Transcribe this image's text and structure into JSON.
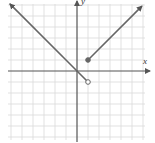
{
  "chart_data": {
    "type": "line",
    "title": "",
    "xlabel": "x",
    "ylabel": "y",
    "grid": true,
    "xlim": [
      -6,
      6
    ],
    "ylim": [
      -6,
      6
    ],
    "grid_spacing": 1,
    "tick_labels": false,
    "series": [
      {
        "name": "left-piece",
        "equation": "y = -x",
        "domain": "x < 1",
        "points": [
          [
            -6.1,
            6.1
          ],
          [
            0,
            0
          ],
          [
            1,
            -1
          ]
        ],
        "start_arrow": true,
        "end_marker": "open-circle"
      },
      {
        "name": "right-piece",
        "equation": "y = x",
        "domain": "x >= 1",
        "points": [
          [
            1,
            1
          ],
          [
            5.9,
            5.9
          ]
        ],
        "start_marker": "filled-circle",
        "end_arrow": true
      }
    ],
    "markers": [
      {
        "x": 1,
        "y": 1,
        "type": "filled"
      },
      {
        "x": 1,
        "y": -1,
        "type": "open"
      }
    ]
  },
  "axes": {
    "x_label": "x",
    "y_label": "y"
  },
  "colors": {
    "grid": "#d9d9d9",
    "axis": "#555555",
    "line": "#666666"
  }
}
